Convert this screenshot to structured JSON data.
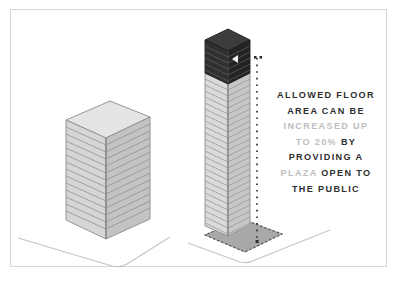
{
  "diagram": {
    "frame_color": "#d8d8d8",
    "background": "#ffffff"
  },
  "callout": {
    "name": "bonus-floor-area-callout",
    "lines": [
      {
        "segments": [
          {
            "text": "ALLOWED FLOOR",
            "emphasis": "strong"
          }
        ]
      },
      {
        "segments": [
          {
            "text": "AREA CAN BE",
            "emphasis": "strong"
          }
        ]
      },
      {
        "segments": [
          {
            "text": "INCREASED UP",
            "emphasis": "dim"
          }
        ]
      },
      {
        "segments": [
          {
            "text": "TO 20%",
            "emphasis": "dim"
          },
          {
            "text": " BY",
            "emphasis": "strong"
          }
        ]
      },
      {
        "segments": [
          {
            "text": "PROVIDING A",
            "emphasis": "strong"
          }
        ]
      },
      {
        "segments": [
          {
            "text": "PLAZA",
            "emphasis": "dim"
          },
          {
            "text": " OPEN TO",
            "emphasis": "strong"
          }
        ]
      },
      {
        "segments": [
          {
            "text": "THE PUBLIC",
            "emphasis": "strong"
          }
        ]
      }
    ],
    "colors": {
      "strong": "#2e2e2e",
      "dim": "#bdbdbd"
    }
  },
  "buildings": {
    "base_building": {
      "label": "base-building",
      "floors": 14,
      "face_left_color": "#d4d4d4",
      "face_right_color": "#c2c2c2",
      "roof_color": "#e2e2e2",
      "outline_color": "#8c8c8c"
    },
    "bonus_tower": {
      "label": "bonus-tower",
      "lower_floors": 26,
      "bonus_floors": 6,
      "lower_face_left_color": "#d9d9d9",
      "lower_face_right_color": "#c6c6c6",
      "bonus_face_left_color": "#2f2f2f",
      "bonus_face_right_color": "#232323",
      "bonus_roof_color": "#3a3a3a",
      "outline_color": "#8c8c8c",
      "arrow": {
        "name": "up-arrow-marker",
        "color": "#ffffff",
        "direction": "up"
      }
    }
  },
  "plaza": {
    "label": "public-plaza",
    "fill_color": "#a8a8a8",
    "outline_style": "dashed",
    "outline_color": "#555555"
  },
  "dimension_line": {
    "label": "bonus-height-dimension",
    "style": "dotted",
    "color": "#2e2e2e"
  },
  "ground": {
    "label": "ground-plane-lines",
    "color": "#bfbfbf"
  }
}
